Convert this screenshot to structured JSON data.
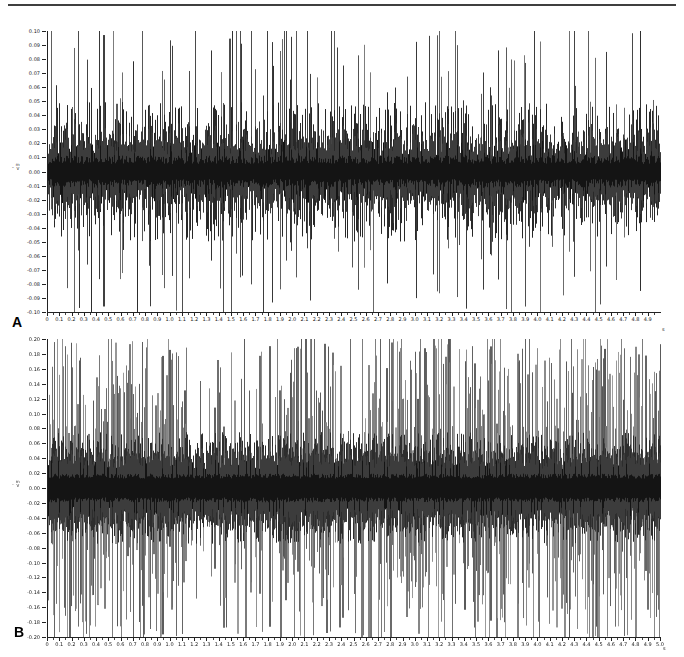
{
  "figure": {
    "background": "#ffffff",
    "top_border_color": "#3f3f3f",
    "trace_color": "#141414",
    "axis_color": "#222222"
  },
  "chart_data": [
    {
      "type": "line",
      "panel_label": "A",
      "title": "",
      "xlabel": "",
      "ylabel": "",
      "x_unit": "s",
      "y_unit_prefix": "-",
      "y_unit_top": "m",
      "y_unit_bottom": "V",
      "xlim": [
        0,
        5.0
      ],
      "ylim": [
        -0.1,
        0.1
      ],
      "grid": false,
      "legend": "none",
      "y_tick_labels": [
        "0.10",
        "0.09",
        "0.08",
        "0.07",
        "0.06",
        "0.05",
        "0.04",
        "0.03",
        "0.02",
        "0.01",
        "0.00",
        "-0.01",
        "-0.02",
        "-0.03",
        "-0.04",
        "-0.05",
        "-0.06",
        "-0.07",
        "-0.08",
        "-0.09",
        "-0.10"
      ],
      "x_tick_labels": [
        "0",
        "0.1",
        "0.2",
        "0.3",
        "0.4",
        "0.5",
        "0.6",
        "0.7",
        "0.8",
        "0.9",
        "1.0",
        "1.1",
        "1.2",
        "1.3",
        "1.4",
        "1.5",
        "1.6",
        "1.7",
        "1.8",
        "1.9",
        "2.0",
        "2.1",
        "2.2",
        "2.3",
        "2.4",
        "2.5",
        "2.6",
        "2.7",
        "2.8",
        "2.9",
        "3.0",
        "3.1",
        "3.2",
        "3.3",
        "3.4",
        "3.5",
        "3.6",
        "3.7",
        "3.8",
        "3.9",
        "4.0",
        "4.1",
        "4.2",
        "4.3",
        "4.4",
        "4.5",
        "4.6",
        "4.7",
        "4.8",
        "4.9"
      ],
      "description": "Raw electrophysiological trace: continuous baseline noise band of about ±0.02 with intermittent sparse large spikes clipped at ±0.10, clustered irregularly over 0–5 s.",
      "signal": {
        "seed": 1337,
        "noise_halfwidth": 0.015,
        "noise_var": 0.012,
        "hair_rate": 0.8,
        "mid_spike_rate": 0.5,
        "mid_spike_max": 0.05,
        "tall_spike_rate": 0.18,
        "tall_min": 0.045,
        "tall_max": 0.12,
        "clip": 0.1,
        "band_gray": 20,
        "mid_gray": 40,
        "spike_gray_min": 45,
        "spike_gray_max": 125,
        "wide_bar_rate": 0.05
      }
    },
    {
      "type": "line",
      "panel_label": "B",
      "title": "",
      "xlabel": "",
      "ylabel": "",
      "x_unit": "s",
      "y_unit_prefix": "-",
      "y_unit_top": "m",
      "y_unit_bottom": "V",
      "xlim": [
        0,
        5.0
      ],
      "ylim": [
        -0.2,
        0.2
      ],
      "grid": false,
      "legend": "none",
      "y_tick_labels": [
        "0.20",
        "0.18",
        "0.16",
        "0.14",
        "0.12",
        "0.10",
        "0.08",
        "0.06",
        "0.04",
        "0.02",
        "0.00",
        "-0.02",
        "-0.04",
        "-0.06",
        "-0.08",
        "-0.10",
        "-0.12",
        "-0.14",
        "-0.16",
        "-0.18",
        "-0.20"
      ],
      "x_tick_labels": [
        "0",
        "0.1",
        "0.2",
        "0.3",
        "0.4",
        "0.5",
        "0.6",
        "0.7",
        "0.8",
        "0.9",
        "1.0",
        "1.1",
        "1.2",
        "1.3",
        "1.4",
        "1.5",
        "1.6",
        "1.7",
        "1.8",
        "1.9",
        "2.0",
        "2.1",
        "2.2",
        "2.3",
        "2.4",
        "2.5",
        "2.6",
        "2.7",
        "2.8",
        "2.9",
        "3.0",
        "3.1",
        "3.2",
        "3.3",
        "3.4",
        "3.5",
        "3.6",
        "3.7",
        "3.8",
        "3.9",
        "4.0",
        "4.1",
        "4.2",
        "4.3",
        "4.4",
        "4.5",
        "4.6",
        "4.7",
        "4.8",
        "4.9",
        "5.0"
      ],
      "description": "Raw electrophysiological trace with dense high-amplitude spiking: baseline noise band of about ±0.04 and very frequent tall spikes reaching near ±0.20 across the whole 0–5 s record.",
      "signal": {
        "seed": 9042,
        "noise_halfwidth": 0.03,
        "noise_var": 0.013,
        "hair_rate": 0.85,
        "mid_spike_rate": 0.7,
        "mid_spike_max": 0.075,
        "tall_spike_rate": 0.75,
        "tall_min": 0.07,
        "tall_max": 0.22,
        "clip": 0.2,
        "band_gray": 20,
        "mid_gray": 45,
        "spike_gray_min": 85,
        "spike_gray_max": 160,
        "wide_bar_rate": 0.22
      }
    }
  ]
}
